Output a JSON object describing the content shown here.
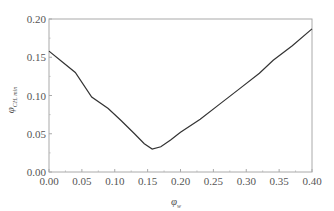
{
  "chart_data": {
    "type": "line",
    "title": "",
    "xlabel": "φ_w",
    "ylabel": "φ_CH, min",
    "xlabel_main": "φ",
    "xlabel_sub": "w",
    "ylabel_main": "φ",
    "ylabel_sub": "CH, min",
    "xlim": [
      0.0,
      0.4
    ],
    "ylim": [
      0.0,
      0.2
    ],
    "grid": false,
    "legend": null,
    "xticks": [
      "0.00",
      "0.05",
      "0.10",
      "0.15",
      "0.20",
      "0.25",
      "0.30",
      "0.35",
      "0.40"
    ],
    "yticks": [
      "0.00",
      "0.05",
      "0.10",
      "0.15",
      "0.20"
    ],
    "series": [
      {
        "name": "φ_CH,min",
        "color": "#333333",
        "x": [
          0.0,
          0.02,
          0.04,
          0.065,
          0.09,
          0.11,
          0.13,
          0.145,
          0.157,
          0.17,
          0.185,
          0.2,
          0.23,
          0.26,
          0.29,
          0.32,
          0.341,
          0.37,
          0.4
        ],
        "y": [
          0.158,
          0.144,
          0.13,
          0.098,
          0.083,
          0.067,
          0.05,
          0.037,
          0.03,
          0.033,
          0.042,
          0.052,
          0.069,
          0.089,
          0.109,
          0.129,
          0.146,
          0.165,
          0.187
        ]
      }
    ]
  }
}
